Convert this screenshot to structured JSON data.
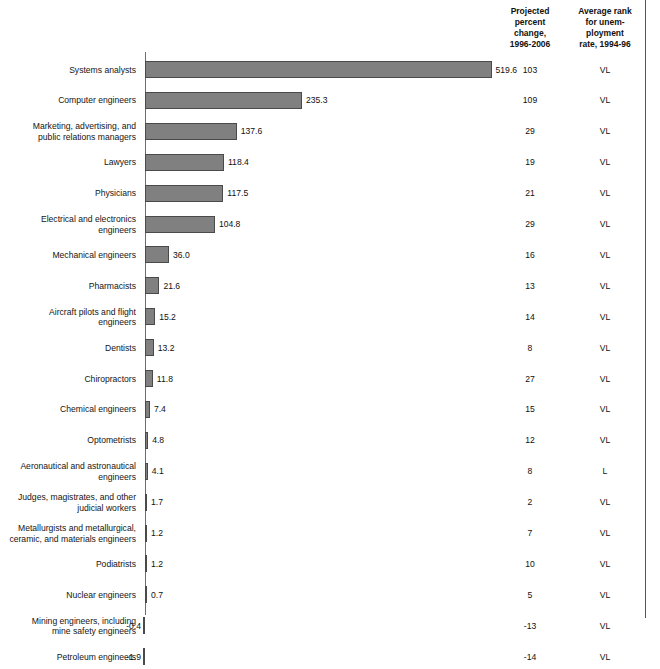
{
  "header": {
    "col_change": "Projected\npercent\nchange,\n1996-2006",
    "col_rank": "Average rank\nfor unem-\nployment\nrate, 1994-96"
  },
  "style": {
    "bar_fill": "#808080",
    "bar_border": "#4a4a4a",
    "axis_color": "#6d6d6d",
    "text_color": "#111111"
  },
  "chart_data": {
    "type": "bar",
    "orientation": "horizontal",
    "title": "",
    "xlabel": "",
    "ylabel": "",
    "grid": false,
    "legend": null,
    "xlim": [
      -1.9,
      519.6
    ],
    "axis_zero_at_px": 145,
    "px_per_unit": 0.667,
    "categories": [
      "Systems analysts",
      "Computer engineers",
      "Marketing, advertising, and public relations managers",
      "Lawyers",
      "Physicians",
      "Electrical and electronics engineers",
      "Mechanical engineers",
      "Pharmacists",
      "Aircraft pilots and flight engineers",
      "Dentists",
      "Chiropractors",
      "Chemical engineers",
      "Optometrists",
      "Aeronautical and astronautical engineers",
      "Judges, magistrates, and other judicial workers",
      "Metallurgists and metallurgical, ceramic, and materials engineers",
      "Podiatrists",
      "Nuclear engineers",
      "Mining engineers, including mine safety engineers",
      "Petroleum engineers"
    ],
    "values": [
      519.6,
      235.3,
      137.6,
      118.4,
      117.5,
      104.8,
      36.0,
      21.6,
      15.2,
      13.2,
      11.8,
      7.4,
      4.8,
      4.1,
      1.7,
      1.2,
      1.2,
      0.7,
      -0.4,
      -1.9
    ],
    "value_labels": [
      "519.6",
      "235.3",
      "137.6",
      "118.4",
      "117.5",
      "104.8",
      "36.0",
      "21.6",
      "15.2",
      "13.2",
      "11.8",
      "7.4",
      "4.8",
      "4.1",
      "1.7",
      "1.2",
      "1.2",
      "0.7",
      "-0.4",
      "-1.9"
    ],
    "series": [
      {
        "name": "Projected percent change, 1996-2006",
        "values": [
          103,
          109,
          29,
          19,
          21,
          29,
          16,
          13,
          14,
          8,
          27,
          15,
          12,
          8,
          2,
          7,
          10,
          5,
          -13,
          -14
        ]
      },
      {
        "name": "Average rank for unemployment rate, 1994-96",
        "values": [
          "VL",
          "VL",
          "VL",
          "VL",
          "VL",
          "VL",
          "VL",
          "VL",
          "VL",
          "VL",
          "VL",
          "VL",
          "VL",
          "L",
          "VL",
          "VL",
          "VL",
          "VL",
          "VL",
          "VL"
        ]
      }
    ]
  },
  "rows": [
    {
      "label": "Systems analysts",
      "value": 519.6,
      "value_label": "519.6",
      "change": "103",
      "rank": "VL"
    },
    {
      "label": "Computer engineers",
      "value": 235.3,
      "value_label": "235.3",
      "change": "109",
      "rank": "VL"
    },
    {
      "label": "Marketing, advertising, and\npublic relations managers",
      "value": 137.6,
      "value_label": "137.6",
      "change": "29",
      "rank": "VL"
    },
    {
      "label": "Lawyers",
      "value": 118.4,
      "value_label": "118.4",
      "change": "19",
      "rank": "VL"
    },
    {
      "label": "Physicians",
      "value": 117.5,
      "value_label": "117.5",
      "change": "21",
      "rank": "VL"
    },
    {
      "label": "Electrical and electronics\nengineers",
      "value": 104.8,
      "value_label": "104.8",
      "change": "29",
      "rank": "VL"
    },
    {
      "label": "Mechanical engineers",
      "value": 36.0,
      "value_label": "36.0",
      "change": "16",
      "rank": "VL"
    },
    {
      "label": "Pharmacists",
      "value": 21.6,
      "value_label": "21.6",
      "change": "13",
      "rank": "VL"
    },
    {
      "label": "Aircraft pilots and flight\nengineers",
      "value": 15.2,
      "value_label": "15.2",
      "change": "14",
      "rank": "VL"
    },
    {
      "label": "Dentists",
      "value": 13.2,
      "value_label": "13.2",
      "change": "8",
      "rank": "VL"
    },
    {
      "label": "Chiropractors",
      "value": 11.8,
      "value_label": "11.8",
      "change": "27",
      "rank": "VL"
    },
    {
      "label": "Chemical engineers",
      "value": 7.4,
      "value_label": "7.4",
      "change": "15",
      "rank": "VL"
    },
    {
      "label": "Optometrists",
      "value": 4.8,
      "value_label": "4.8",
      "change": "12",
      "rank": "VL"
    },
    {
      "label": "Aeronautical and astronautical\nengineers",
      "value": 4.1,
      "value_label": "4.1",
      "change": "8",
      "rank": "L"
    },
    {
      "label": "Judges, magistrates, and other\njudicial workers",
      "value": 1.7,
      "value_label": "1.7",
      "change": "2",
      "rank": "VL"
    },
    {
      "label": "Metallurgists and metallurgical,\nceramic, and materials engineers",
      "value": 1.2,
      "value_label": "1.2",
      "change": "7",
      "rank": "VL"
    },
    {
      "label": "Podiatrists",
      "value": 1.2,
      "value_label": "1.2",
      "change": "10",
      "rank": "VL"
    },
    {
      "label": "Nuclear engineers",
      "value": 0.7,
      "value_label": "0.7",
      "change": "5",
      "rank": "VL"
    },
    {
      "label": "Mining engineers, including\nmine safety engineers",
      "value": -0.4,
      "value_label": "-0.4",
      "change": "-13",
      "rank": "VL"
    },
    {
      "label": "Petroleum engineers",
      "value": -1.9,
      "value_label": "-1.9",
      "change": "-14",
      "rank": "VL"
    }
  ]
}
